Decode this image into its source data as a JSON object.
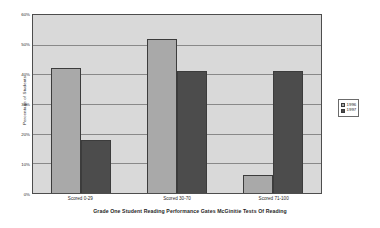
{
  "chart_data": {
    "type": "bar",
    "title": "",
    "caption": "Grade One Student Reading Performance Gates McGinitie Tests Of Reading",
    "xlabel": "Grade One Student Reading Performance Gates McGinitie Tests Of Reading",
    "ylabel": "Percentage of Students",
    "categories": [
      "Scored 0-29",
      "Scored 30-70",
      "Scored 71-100"
    ],
    "series": [
      {
        "name": "1996",
        "values": [
          42,
          52,
          6
        ],
        "color": "#a9a9a9"
      },
      {
        "name": "1997",
        "values": [
          18,
          41,
          41
        ],
        "color": "#4c4c4c"
      }
    ],
    "ylim": [
      0,
      60
    ],
    "ytick_step": 10,
    "ytick_labels": [
      "0%",
      "10%",
      "20%",
      "30%",
      "40%",
      "50%",
      "60%"
    ],
    "ytick_values": [
      0,
      10,
      20,
      30,
      40,
      50,
      60
    ],
    "grid": true,
    "legend_position": "right",
    "plot_background": "#d9d9d9",
    "page_background": "#ffffff",
    "axis_color": "#4d4d4d"
  }
}
